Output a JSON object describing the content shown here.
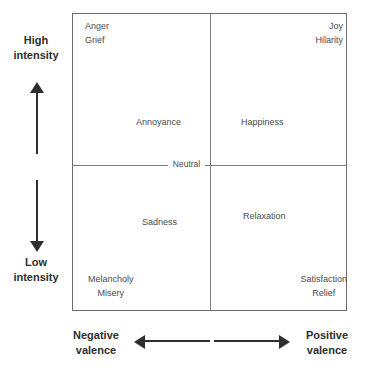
{
  "diagram": {
    "type": "valence-arousal-quadrant",
    "center_label": "Neutral",
    "axes": {
      "vertical": {
        "high_label": "High\nintensity",
        "high_label_line1": "High",
        "high_label_line2": "intensity",
        "low_label_line1": "Low",
        "low_label_line2": "intensity",
        "up_arrow": "arrow-up-icon",
        "down_arrow": "arrow-down-icon"
      },
      "horizontal": {
        "negative_label_line1": "Negative",
        "negative_label_line2": "valence",
        "positive_label_line1": "Positive",
        "positive_label_line2": "valence",
        "left_arrow": "arrow-left-icon",
        "right_arrow": "arrow-right-icon"
      }
    },
    "quadrants": {
      "top_left": {
        "corner_terms": [
          "Anger",
          "Grief"
        ],
        "mid_term": "Annoyance"
      },
      "top_right": {
        "corner_terms": [
          "Joy",
          "Hilarity"
        ],
        "mid_term": "Happiness"
      },
      "bottom_left": {
        "corner_terms": [
          "Melancholy",
          "Misery"
        ],
        "mid_term": "Sadness"
      },
      "bottom_right": {
        "corner_terms": [
          "Satisfaction",
          "Relief"
        ],
        "mid_term": "Relaxation"
      }
    },
    "colors": {
      "frame": "#6b6b6b",
      "divider": "#7d7d7d",
      "term_text": "#4a4a4a",
      "caption_text": "#2e2e2e",
      "arrow": "#2e2e2e",
      "background": "#ffffff"
    }
  }
}
